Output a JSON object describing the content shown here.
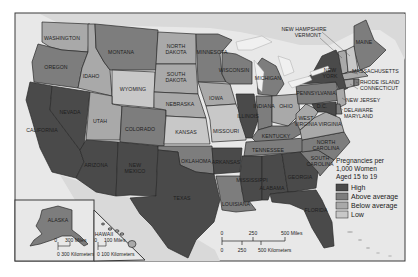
{
  "map": {
    "title": "Teen Pregnancy Rates by State",
    "colors": {
      "high": "#4a4a4a",
      "above_average": "#7d7d7d",
      "below_average": "#a9a9a9",
      "low": "#c8c8c8",
      "water": "#e6e6e6",
      "land_other": "#d6d6d6",
      "frame": "#3a3a3a"
    },
    "states": {
      "washington": {
        "label": "WASHINGTON",
        "category": "below_average"
      },
      "oregon": {
        "label": "OREGON",
        "category": "above_average"
      },
      "california": {
        "label": "CALIFORNIA",
        "category": "high"
      },
      "nevada": {
        "label": "NEVADA",
        "category": "high"
      },
      "idaho": {
        "label": "IDAHO",
        "category": "below_average"
      },
      "montana": {
        "label": "MONTANA",
        "category": "above_average"
      },
      "wyoming": {
        "label": "WYOMING",
        "category": "low"
      },
      "utah": {
        "label": "UTAH",
        "category": "below_average"
      },
      "colorado": {
        "label": "COLORADO",
        "category": "above_average"
      },
      "arizona": {
        "label": "ARIZONA",
        "category": "high"
      },
      "new_mexico": {
        "label": "NEW MEXICO",
        "category": "high"
      },
      "north_dakota": {
        "label": "NORTH DAKOTA",
        "category": "below_average"
      },
      "south_dakota": {
        "label": "SOUTH DAKOTA",
        "category": "below_average"
      },
      "nebraska": {
        "label": "NEBRASKA",
        "category": "below_average"
      },
      "kansas": {
        "label": "KANSAS",
        "category": "low"
      },
      "oklahoma": {
        "label": "OKLAHOMA",
        "category": "above_average"
      },
      "texas": {
        "label": "TEXAS",
        "category": "high"
      },
      "minnesota": {
        "label": "MINNESOTA",
        "category": "above_average"
      },
      "iowa": {
        "label": "IOWA",
        "category": "below_average"
      },
      "missouri": {
        "label": "MISSOURI",
        "category": "low"
      },
      "arkansas": {
        "label": "ARKANSAS",
        "category": "high"
      },
      "louisiana": {
        "label": "LOUISIANA",
        "category": "above_average"
      },
      "wisconsin": {
        "label": "WISCONSIN",
        "category": "above_average"
      },
      "illinois": {
        "label": "ILLINOIS",
        "category": "high"
      },
      "michigan": {
        "label": "MICHIGAN",
        "category": "above_average"
      },
      "indiana": {
        "label": "INDIANA",
        "category": "above_average"
      },
      "ohio": {
        "label": "OHIO",
        "category": "below_average"
      },
      "kentucky": {
        "label": "KENTUCKY",
        "category": "above_average"
      },
      "tennessee": {
        "label": "TENNESSEE",
        "category": "above_average"
      },
      "mississippi": {
        "label": "MISSISSIPPI",
        "category": "high"
      },
      "alabama": {
        "label": "ALABAMA",
        "category": "high"
      },
      "georgia": {
        "label": "GEORGIA",
        "category": "high"
      },
      "florida": {
        "label": "FLORIDA",
        "category": "high"
      },
      "south_carolina": {
        "label": "SOUTH CAROLINA",
        "category": "above_average"
      },
      "north_carolina": {
        "label": "NORTH CAROLINA",
        "category": "above_average"
      },
      "virginia": {
        "label": "VIRGINIA",
        "category": "below_average"
      },
      "west_virginia": {
        "label": "WEST VIRGINIA",
        "category": "below_average"
      },
      "pennsylvania": {
        "label": "PENNSYLVANIA",
        "category": "above_average"
      },
      "new_york": {
        "label": "NEW YORK",
        "category": "high"
      },
      "maine": {
        "label": "MAINE",
        "category": "above_average"
      },
      "new_hampshire": {
        "label": "NEW HAMPSHIRE",
        "category": "low"
      },
      "vermont": {
        "label": "VERMONT",
        "category": "below_average"
      },
      "massachusetts": {
        "label": "MASSACHUSETTS",
        "category": "below_average"
      },
      "rhode_island": {
        "label": "RHODE ISLAND",
        "category": "above_average"
      },
      "connecticut": {
        "label": "CONNECTICUT",
        "category": "below_average"
      },
      "new_jersey": {
        "label": "NEW JERSEY",
        "category": "below_average"
      },
      "delaware": {
        "label": "DELAWARE",
        "category": "above_average"
      },
      "maryland": {
        "label": "MARYLAND",
        "category": "high"
      },
      "dc": {
        "label": "D.C.",
        "category": "high"
      },
      "alaska": {
        "label": "ALASKA",
        "category": "above_average"
      },
      "hawaii": {
        "label": "HAWAII",
        "category": "below_average"
      }
    },
    "legend": {
      "title_line1": "Pregnancies per",
      "title_line2": "1,000 Women",
      "title_line3": "Aged 15 to 19",
      "items": [
        {
          "key": "high",
          "label": "High"
        },
        {
          "key": "above_average",
          "label": "Above average"
        },
        {
          "key": "below_average",
          "label": "Below average"
        },
        {
          "key": "low",
          "label": "Low"
        }
      ]
    },
    "scale_main": {
      "miles_ticks": [
        "0",
        "250",
        "500 Miles"
      ],
      "km_ticks": [
        "0",
        "250",
        "500 Kilometers"
      ]
    },
    "scale_alaska": {
      "miles": "300 Miles",
      "miles_zero": "0",
      "km": "0  300 Kilometers"
    },
    "scale_hawaii": {
      "miles": "100 Miles",
      "miles_zero": "0",
      "km": "0  100 Kilometers"
    }
  }
}
